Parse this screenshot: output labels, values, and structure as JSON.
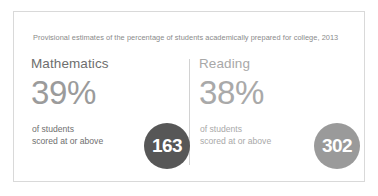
{
  "card": {
    "header": "Provisional estimates of the percentage of students academically prepared for college, 2013"
  },
  "panels": [
    {
      "subject": "Mathematics",
      "percent": "39%",
      "caption_line1": "of students",
      "caption_line2": "scored at or above",
      "badge_value": "163",
      "badge_color": "#575757",
      "subject_color": "#6e6e6e",
      "percent_color": "#9b9b9b",
      "caption_color": "#6f6f6f"
    },
    {
      "subject": "Reading",
      "percent": "38%",
      "caption_line1": "of students",
      "caption_line2": "scored at or above",
      "badge_value": "302",
      "badge_color": "#9a9a9a",
      "subject_color": "#a8a8a8",
      "percent_color": "#a9a9a9",
      "caption_color": "#a9a9a9"
    }
  ],
  "style": {
    "border_color": "#d9d9d9",
    "divider_color": "#d2d2d2",
    "background": "#ffffff"
  }
}
